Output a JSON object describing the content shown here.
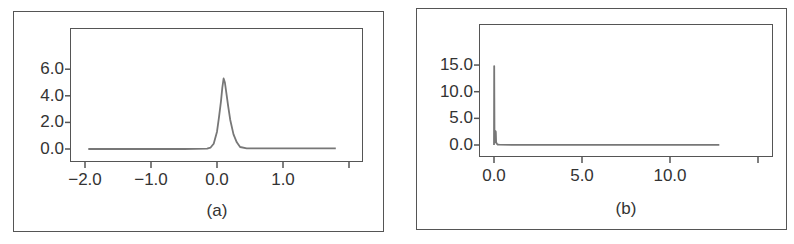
{
  "chart_data": [
    {
      "type": "line",
      "caption": "(a)",
      "title": "",
      "xlabel": "",
      "ylabel": "",
      "xlim": [
        -2.2,
        2.2
      ],
      "ylim": [
        -0.8,
        8.8
      ],
      "xticks": [
        -2.0,
        -1.0,
        0.0,
        1.0,
        2.0
      ],
      "xtick_labels": [
        "−2.0",
        "−1.0",
        "0.0",
        "1.0",
        ""
      ],
      "yticks": [
        0.0,
        2.0,
        4.0,
        6.0
      ],
      "ytick_labels": [
        "0.0",
        "2.0",
        "4.0",
        "6.0"
      ],
      "grid": false,
      "series": [
        {
          "name": "density",
          "x": [
            -1.95,
            -0.5,
            -0.15,
            -0.1,
            -0.05,
            0.0,
            0.03,
            0.06,
            0.08,
            0.1,
            0.12,
            0.14,
            0.17,
            0.2,
            0.25,
            0.3,
            0.35,
            0.45,
            1.0,
            1.8
          ],
          "y": [
            0.0,
            0.0,
            0.02,
            0.1,
            0.4,
            1.3,
            2.4,
            3.6,
            4.6,
            5.3,
            5.0,
            4.3,
            3.2,
            2.2,
            1.1,
            0.5,
            0.15,
            0.05,
            0.05,
            0.05
          ]
        }
      ]
    },
    {
      "type": "line",
      "caption": "(b)",
      "title": "",
      "xlabel": "",
      "ylabel": "",
      "xlim": [
        -0.7,
        15.5
      ],
      "ylim": [
        -1.8,
        20.5
      ],
      "xticks": [
        0.0,
        5.0,
        10.0,
        15.0
      ],
      "xtick_labels": [
        "0.0",
        "5.0",
        "10.0",
        ""
      ],
      "yticks": [
        0.0,
        5.0,
        10.0,
        15.0
      ],
      "ytick_labels": [
        "0.0",
        "5.0",
        "10.0",
        "15.0"
      ],
      "grid": false,
      "series": [
        {
          "name": "density",
          "x": [
            0.0,
            0.01,
            0.03,
            0.05,
            0.08,
            0.1,
            0.12,
            0.15,
            0.2,
            0.3,
            1.0,
            5.0,
            10.0,
            12.8
          ],
          "y": [
            0.0,
            14.8,
            0.8,
            0.5,
            2.6,
            2.5,
            0.6,
            0.3,
            0.1,
            0.05,
            0.02,
            0.02,
            0.02,
            0.02
          ]
        }
      ]
    }
  ]
}
